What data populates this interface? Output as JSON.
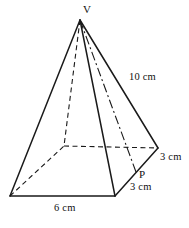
{
  "figure": {
    "type": "square-based-pyramid-diagram",
    "stroke_color": "#1a1a1a",
    "background_color": "#ffffff",
    "labels": {
      "apex": "V",
      "slant_edge": "10 cm",
      "half_edge_upper": "3 cm",
      "midpoint": "P",
      "half_edge_lower": "3 cm",
      "base_edge": "6 cm"
    },
    "geometry": {
      "apex": [
        80,
        20
      ],
      "base_front_left": [
        10,
        196
      ],
      "base_front_right": [
        115,
        196
      ],
      "base_right": [
        158,
        148
      ],
      "base_back_hidden": [
        64,
        146
      ],
      "point_p": [
        136,
        172
      ]
    }
  }
}
